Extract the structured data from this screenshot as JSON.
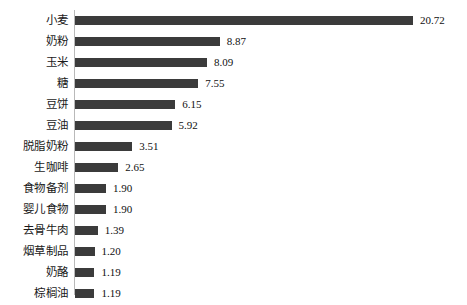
{
  "chart_data": {
    "type": "bar",
    "orientation": "horizontal",
    "title": "",
    "subtitle": "",
    "xlabel": "",
    "ylabel": "",
    "grid": false,
    "legend": null,
    "axis": {
      "category_axis": "vertical-left",
      "value_axis_visible": false,
      "xlim": [
        0,
        20.72
      ]
    },
    "categories": [
      "小麦",
      "奶粉",
      "玉米",
      "糖",
      "豆饼",
      "豆油",
      "脱脂奶粉",
      "生咖啡",
      "食物备剂",
      "婴儿食物",
      "去骨牛肉",
      "烟草制品",
      "奶酪",
      "棕榈油"
    ],
    "values": [
      20.72,
      8.87,
      8.09,
      7.55,
      6.15,
      5.92,
      3.51,
      2.65,
      1.9,
      1.9,
      1.39,
      1.2,
      1.19,
      1.19
    ],
    "value_labels": [
      "20.72",
      "8.87",
      "8.09",
      "7.55",
      "6.15",
      "5.92",
      "3.51",
      "2.65",
      "1.90",
      "1.90",
      "1.39",
      "1.20",
      "1.19",
      "1.19"
    ],
    "colors": {
      "bar": "#3b3b3b",
      "axis": "#b9b9b9",
      "text": "#101010",
      "background": "#ffffff"
    }
  }
}
